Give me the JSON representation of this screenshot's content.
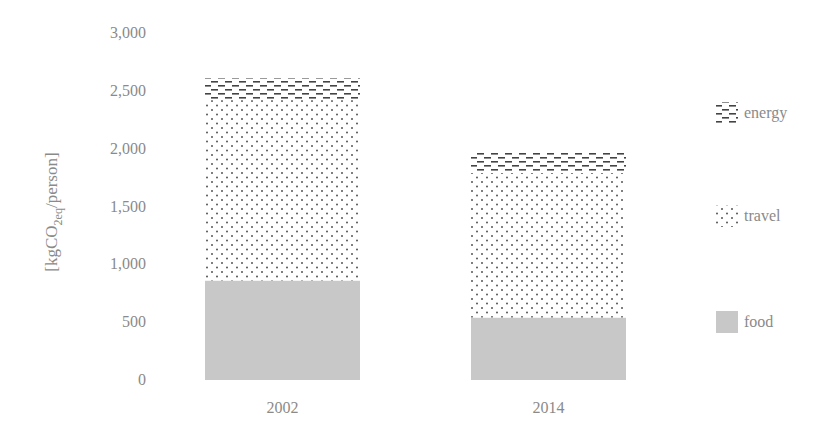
{
  "chart_data": {
    "type": "bar",
    "stacked": true,
    "title": "",
    "xlabel": "",
    "ylabel": "[kgCO2eq/person]",
    "ylabel_parts": {
      "prefix": "[kgCO",
      "sub": "2eq",
      "suffix": "/person]"
    },
    "ylim": [
      0,
      3000
    ],
    "yticks": [
      0,
      500,
      1000,
      1500,
      2000,
      2500,
      3000
    ],
    "ytick_labels": [
      "0",
      "500",
      "1,000",
      "1,500",
      "2,000",
      "2,500",
      "3,000"
    ],
    "grid": false,
    "legend_position": "right",
    "categories": [
      "2002",
      "2014"
    ],
    "series": [
      {
        "name": "food",
        "pattern": "solid-gray",
        "color": "#c8c8c8",
        "values": [
          860,
          540
        ]
      },
      {
        "name": "travel",
        "pattern": "dots",
        "color": "#555555",
        "values": [
          1560,
          1250
        ]
      },
      {
        "name": "energy",
        "pattern": "dashes",
        "color": "#444444",
        "values": [
          190,
          180
        ]
      }
    ],
    "legend": [
      "energy",
      "travel",
      "food"
    ]
  }
}
